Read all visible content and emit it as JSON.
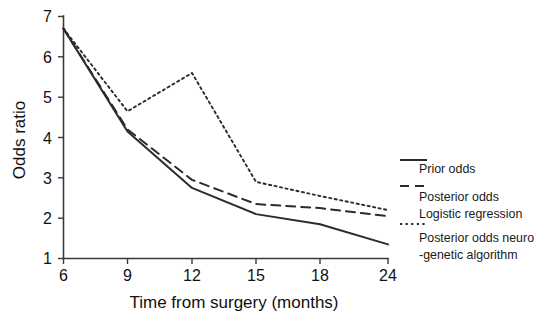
{
  "chart_data": {
    "type": "line",
    "title": "",
    "xlabel": "Time from surgery (months)",
    "ylabel": "Odds ratio",
    "x_tick_labels": [
      "6",
      "9",
      "12",
      "15",
      "18",
      "24"
    ],
    "x_tick_values": [
      6,
      9,
      12,
      15,
      18,
      24
    ],
    "y_tick_labels": [
      "1",
      "2",
      "3",
      "4",
      "5",
      "6",
      "7"
    ],
    "y_tick_values": [
      1,
      2,
      3,
      4,
      5,
      6,
      7
    ],
    "xlim": [
      6,
      24
    ],
    "ylim": [
      1,
      7
    ],
    "grid": false,
    "legend_position": "right",
    "x": [
      6,
      9,
      12,
      15,
      18,
      24
    ],
    "series": [
      {
        "name": "Prior odds",
        "style": "solid",
        "values": [
          6.7,
          4.15,
          2.75,
          2.1,
          1.85,
          1.35
        ]
      },
      {
        "name": "Posterior odds Logistic regression",
        "style": "dashed",
        "values": [
          6.7,
          4.2,
          2.95,
          2.35,
          2.25,
          2.05
        ]
      },
      {
        "name": "Posterior odds neuro-genetic algorithm",
        "style": "dotted",
        "values": [
          6.7,
          4.65,
          5.6,
          2.9,
          2.55,
          2.2
        ]
      }
    ]
  },
  "legend": {
    "entries": [
      {
        "marker": "solid-line-icon",
        "line1": "Prior odds",
        "line2": ""
      },
      {
        "marker": "dashed-line-icon",
        "line1": "Posterior odds",
        "line2": "Logistic regression"
      },
      {
        "marker": "dotted-line-icon",
        "line1": "Posterior odds neuro",
        "line2": "-genetic algorithm"
      }
    ]
  },
  "colors": {
    "line": "#2b2b2b",
    "axis": "#3a3a3a",
    "background": "#ffffff",
    "text": "#111111"
  }
}
